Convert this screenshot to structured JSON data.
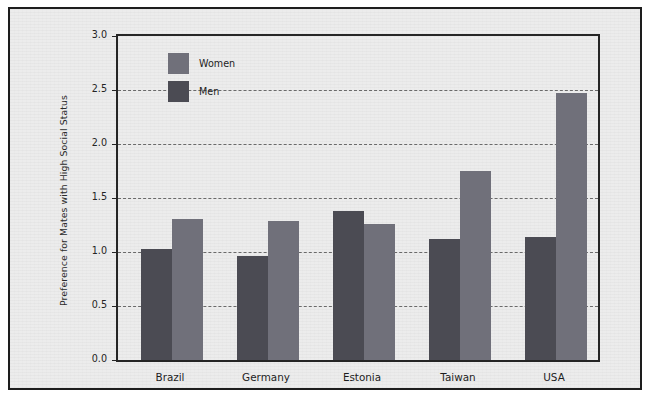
{
  "chart_data": {
    "type": "bar",
    "title": "",
    "subtitle": "",
    "xlabel": "",
    "ylabel": "Preference for Mates with High Social Status",
    "categories": [
      "Brazil",
      "Germany",
      "Estonia",
      "Taiwan",
      "USA"
    ],
    "series": [
      {
        "name": "Men",
        "color": "#4b4b53",
        "values": [
          1.03,
          0.96,
          1.38,
          1.12,
          1.14
        ]
      },
      {
        "name": "Women",
        "color": "#70707a",
        "values": [
          1.31,
          1.29,
          1.26,
          1.75,
          2.47
        ]
      }
    ],
    "ylim": [
      0.0,
      3.0
    ],
    "y_ticks": [
      "0.0",
      "0.5",
      "1.0",
      "1.5",
      "2.0",
      "2.5",
      "3.0"
    ],
    "y_tick_values": [
      0.0,
      0.5,
      1.0,
      1.5,
      2.0,
      2.5,
      3.0
    ],
    "grid": "horizontal-dashed",
    "legend_position": "top-left-inside",
    "legend_order": [
      "Women",
      "Men"
    ],
    "background_color": "#ececec",
    "frame_color": "#1d1d1d",
    "axis_color": "#252525",
    "gridline_color": "#6a6a6a"
  }
}
